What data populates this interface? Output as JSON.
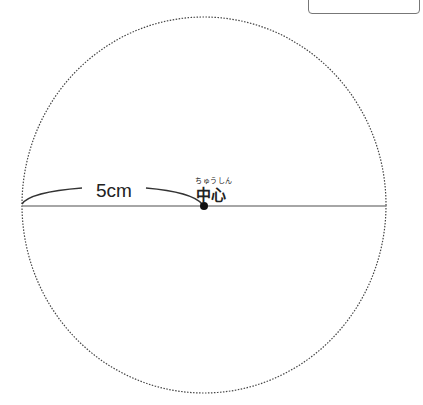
{
  "diagram": {
    "radius_label": "5cm",
    "center_label": "中心",
    "center_ruby": "ちゅうしん",
    "colors": {
      "stroke": "#333333",
      "line": "#888888"
    }
  }
}
